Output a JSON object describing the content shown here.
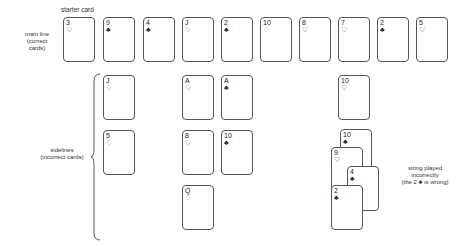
{
  "labels": {
    "starter": "starter card",
    "main_line_1": "main line",
    "main_line_2": "(correct",
    "main_line_3": "cards)",
    "sidelines_1": "sidelines",
    "sidelines_2": "(incorrect cards)",
    "string_1": "string played",
    "string_2": "incorrectly",
    "string_3": "(the 2 ♣ is wrong)"
  },
  "main_line": [
    {
      "rank": "3",
      "suit": "♡"
    },
    {
      "rank": "9",
      "suit": "♣"
    },
    {
      "rank": "4",
      "suit": "♣"
    },
    {
      "rank": "J",
      "suit": "♢"
    },
    {
      "rank": "2",
      "suit": "♣"
    },
    {
      "rank": "10",
      "suit": "♢"
    },
    {
      "rank": "8",
      "suit": "♡"
    },
    {
      "rank": "7",
      "suit": "♡"
    },
    {
      "rank": "2",
      "suit": "♣"
    },
    {
      "rank": "5",
      "suit": "♡"
    }
  ],
  "sidelines": [
    {
      "rank": "J",
      "suit": "♢"
    },
    {
      "rank": "5",
      "suit": "♢"
    },
    {
      "rank": "A",
      "suit": "♡"
    },
    {
      "rank": "8",
      "suit": "♡"
    },
    {
      "rank": "Q",
      "suit": "♢"
    },
    {
      "rank": "A",
      "suit": "♣"
    },
    {
      "rank": "10",
      "suit": "♣"
    },
    {
      "rank": "10",
      "suit": "♡"
    }
  ],
  "string": [
    {
      "rank": "10",
      "suit": "♣"
    },
    {
      "rank": "9",
      "suit": "♡"
    },
    {
      "rank": "4",
      "suit": "♣"
    },
    {
      "rank": "2",
      "suit": "♣"
    }
  ]
}
